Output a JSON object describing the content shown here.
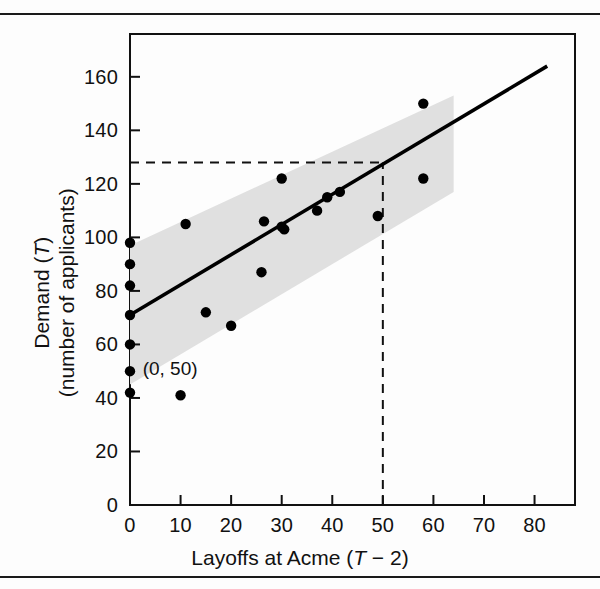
{
  "figure": {
    "background_color": "#fdfdfd",
    "rule_color": "#1a1a1a",
    "axis_color": "#111111",
    "band_color": "#e0e0e0",
    "point_color": "#000000",
    "line_color": "#000000"
  },
  "axis_titles": {
    "x_prefix": "Layoffs at Acme (",
    "x_italic": "T",
    "x_suffix": " − 2)",
    "y_line1_prefix": "Demand (",
    "y_line1_italic": "T",
    "y_line1_suffix": ")",
    "y_line2": "(number of applicants)"
  },
  "annotation": {
    "label": "(0, 50)"
  },
  "chart_data": {
    "type": "scatter",
    "title": "",
    "xlabel": "Layoffs at Acme (T − 2)",
    "ylabel": "Demand (T) (number of applicants)",
    "xlim": [
      0,
      88
    ],
    "ylim": [
      0,
      176
    ],
    "xticks": [
      0,
      10,
      20,
      30,
      40,
      50,
      60,
      70,
      80
    ],
    "xticklabels": [
      "0",
      "10",
      "20",
      "30",
      "40",
      "50",
      "60",
      "70",
      "80"
    ],
    "yticks": [
      0,
      20,
      40,
      60,
      80,
      100,
      120,
      140,
      160
    ],
    "yticklabels": [
      "0",
      "20",
      "40",
      "60",
      "80",
      "100",
      "120",
      "140",
      "160"
    ],
    "grid": false,
    "legend": "none",
    "points": [
      {
        "x": 0,
        "y": 98
      },
      {
        "x": 0,
        "y": 90
      },
      {
        "x": 0,
        "y": 82
      },
      {
        "x": 0,
        "y": 71
      },
      {
        "x": 0,
        "y": 60
      },
      {
        "x": 0,
        "y": 50
      },
      {
        "x": 0,
        "y": 42
      },
      {
        "x": 10,
        "y": 41
      },
      {
        "x": 11,
        "y": 105
      },
      {
        "x": 15,
        "y": 72
      },
      {
        "x": 20,
        "y": 67
      },
      {
        "x": 26,
        "y": 87
      },
      {
        "x": 26.5,
        "y": 106
      },
      {
        "x": 30,
        "y": 122
      },
      {
        "x": 30,
        "y": 104
      },
      {
        "x": 30.5,
        "y": 103
      },
      {
        "x": 37,
        "y": 110
      },
      {
        "x": 39,
        "y": 115
      },
      {
        "x": 41.5,
        "y": 117
      },
      {
        "x": 49,
        "y": 108
      },
      {
        "x": 58,
        "y": 150
      },
      {
        "x": 58,
        "y": 122
      }
    ],
    "regression_line": {
      "label": "least-squares fit",
      "x_start": 0,
      "y_start": 71,
      "x_end": 82.5,
      "y_end": 164
    },
    "confidence_band": {
      "label": "prediction band",
      "x_start": 0,
      "x_end": 64,
      "upper_start": 97,
      "upper_end": 153,
      "lower_start": 45,
      "lower_end": 117
    },
    "reference_lines": [
      {
        "orientation": "horizontal",
        "value": 128,
        "style": "dashed",
        "from_x": 0,
        "to_x": 50
      },
      {
        "orientation": "vertical",
        "value": 50,
        "style": "dashed",
        "from_y": 0,
        "to_y": 128
      }
    ],
    "annotations": [
      {
        "text": "(0, 50)",
        "x": 2.5,
        "y": 50
      }
    ]
  }
}
